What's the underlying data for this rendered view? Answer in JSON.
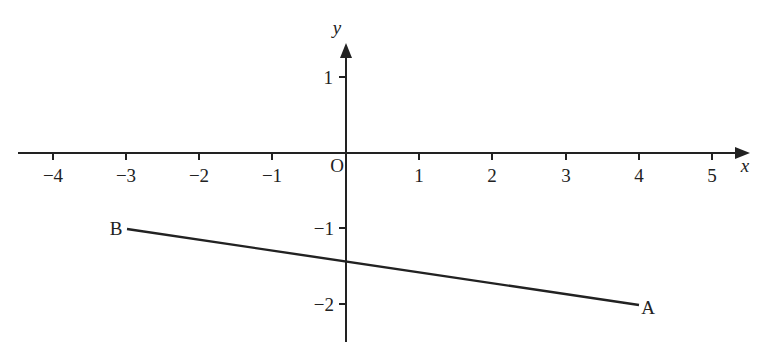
{
  "diagram": {
    "type": "coordinate-plane-line-segment",
    "axes": {
      "x_label": "x",
      "y_label": "y",
      "origin_label": "O",
      "x_ticks": [
        "−4",
        "−3",
        "−2",
        "−1",
        "1",
        "2",
        "3",
        "4",
        "5"
      ],
      "y_ticks": [
        "1",
        "−1",
        "−2"
      ]
    },
    "points": [
      {
        "label": "B",
        "x": -3,
        "y": -1
      },
      {
        "label": "A",
        "x": 4,
        "y": -2
      }
    ],
    "segment": {
      "from": "B",
      "to": "A"
    }
  },
  "labels": {
    "x_axis": "x",
    "y_axis": "y",
    "origin": "O",
    "x_tick_m4": "−4",
    "x_tick_m3": "−3",
    "x_tick_m2": "−2",
    "x_tick_m1": "−1",
    "x_tick_1": "1",
    "x_tick_2": "2",
    "x_tick_3": "3",
    "x_tick_4": "4",
    "x_tick_5": "5",
    "y_tick_1": "1",
    "y_tick_m1": "−1",
    "y_tick_m2": "−2",
    "point_a": "A",
    "point_b": "B"
  },
  "colors": {
    "line": "#222222",
    "background": "#ffffff"
  }
}
